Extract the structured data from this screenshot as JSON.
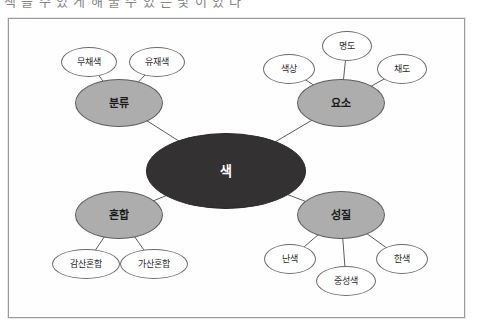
{
  "page": {
    "header_remnant": "색 을 수 있 게 해 줄 수 있 는 빛 이 있 다",
    "frame_border_color": "#9a9a9a",
    "background_color": "#ffffff"
  },
  "diagram": {
    "type": "mind-map",
    "title": "색",
    "colors": {
      "center_fill": "#333132",
      "center_text": "#ffffff",
      "branch_fill": "#adadad",
      "branch_stroke": "#5e5e5e",
      "leaf_fill": "#ffffff",
      "leaf_stroke": "#6b6b6b",
      "edge_stroke": "#4a4a4a"
    },
    "center": {
      "label": "색",
      "x": 217,
      "y": 152,
      "rw": 80,
      "rh": 38
    },
    "branches": [
      {
        "id": "bunryu",
        "label": "분류",
        "x": 110,
        "y": 84,
        "rw": 44,
        "rh": 24,
        "leaves": [
          {
            "id": "muchaesaek",
            "label": "무채색",
            "x": 80,
            "y": 43,
            "rw": 28,
            "rh": 15
          },
          {
            "id": "yuchaesaek",
            "label": "유재색",
            "x": 148,
            "y": 43,
            "rw": 28,
            "rh": 15
          }
        ]
      },
      {
        "id": "yoso",
        "label": "요소",
        "x": 332,
        "y": 84,
        "rw": 44,
        "rh": 24,
        "leaves": [
          {
            "id": "saeksang",
            "label": "색상",
            "x": 280,
            "y": 50,
            "rw": 26,
            "rh": 15
          },
          {
            "id": "myeongdo",
            "label": "명도",
            "x": 338,
            "y": 27,
            "rw": 25,
            "rh": 15
          },
          {
            "id": "chaedo",
            "label": "채도",
            "x": 393,
            "y": 50,
            "rw": 25,
            "rh": 15
          }
        ]
      },
      {
        "id": "honhap",
        "label": "혼합",
        "x": 110,
        "y": 196,
        "rw": 44,
        "rh": 24,
        "leaves": [
          {
            "id": "gamsan-honhap",
            "label": "감산혼합",
            "x": 77,
            "y": 245,
            "rw": 34,
            "rh": 15
          },
          {
            "id": "gasan-honhap",
            "label": "가산혼합",
            "x": 145,
            "y": 245,
            "rw": 34,
            "rh": 15
          }
        ]
      },
      {
        "id": "seongjil",
        "label": "성질",
        "x": 332,
        "y": 196,
        "rw": 44,
        "rh": 24,
        "leaves": [
          {
            "id": "nansaek",
            "label": "난색",
            "x": 281,
            "y": 240,
            "rw": 26,
            "rh": 15
          },
          {
            "id": "jungseongsaek",
            "label": "중성색",
            "x": 337,
            "y": 262,
            "rw": 30,
            "rh": 15
          },
          {
            "id": "hansaek",
            "label": "한색",
            "x": 393,
            "y": 240,
            "rw": 26,
            "rh": 15
          }
        ]
      }
    ]
  }
}
